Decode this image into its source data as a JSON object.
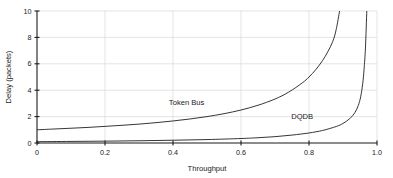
{
  "chart_data": {
    "type": "line",
    "title": "",
    "subtitle": "",
    "xlabel": "Throughput",
    "ylabel": "Delay (packets)",
    "xlim": [
      0,
      1.0
    ],
    "ylim": [
      0,
      10
    ],
    "grid": true,
    "legend_position": "inline-annotations",
    "xticks": [
      "0",
      "0.2",
      "0.4",
      "0.6",
      "0.8",
      "1.0"
    ],
    "xtick_values": [
      0,
      0.2,
      0.4,
      0.6,
      0.8,
      1.0
    ],
    "yticks": [
      "0",
      "2",
      "4",
      "6",
      "8",
      "10"
    ],
    "ytick_values": [
      0,
      2,
      4,
      6,
      8,
      10
    ],
    "annotations": [
      {
        "text": "Token Bus",
        "x": 0.44,
        "y": 2.85
      },
      {
        "text": "DQDB",
        "x": 0.78,
        "y": 1.85
      }
    ],
    "series": [
      {
        "name": "Token Bus",
        "x": [
          0.0,
          0.05,
          0.1,
          0.15,
          0.2,
          0.25,
          0.3,
          0.35,
          0.4,
          0.45,
          0.5,
          0.55,
          0.6,
          0.65,
          0.7,
          0.74,
          0.78,
          0.8,
          0.82,
          0.84,
          0.855,
          0.87,
          0.88,
          0.89
        ],
        "y": [
          1.0,
          1.06,
          1.12,
          1.18,
          1.26,
          1.34,
          1.43,
          1.54,
          1.67,
          1.82,
          2.0,
          2.22,
          2.5,
          2.86,
          3.33,
          3.85,
          4.55,
          5.0,
          5.56,
          6.25,
          6.9,
          7.7,
          8.6,
          10.0
        ]
      },
      {
        "name": "DQDB",
        "x": [
          0.0,
          0.1,
          0.2,
          0.3,
          0.4,
          0.5,
          0.6,
          0.65,
          0.7,
          0.75,
          0.8,
          0.84,
          0.88,
          0.9,
          0.92,
          0.935,
          0.945,
          0.952,
          0.958,
          0.962,
          0.966,
          0.97
        ],
        "y": [
          0.1,
          0.12,
          0.14,
          0.17,
          0.21,
          0.26,
          0.34,
          0.4,
          0.48,
          0.6,
          0.76,
          0.95,
          1.25,
          1.48,
          1.85,
          2.3,
          2.85,
          3.5,
          4.5,
          5.6,
          7.2,
          10.0
        ]
      }
    ]
  },
  "geometry": {
    "plot_left": 37,
    "plot_right": 377,
    "plot_top": 11,
    "plot_bottom": 143
  }
}
